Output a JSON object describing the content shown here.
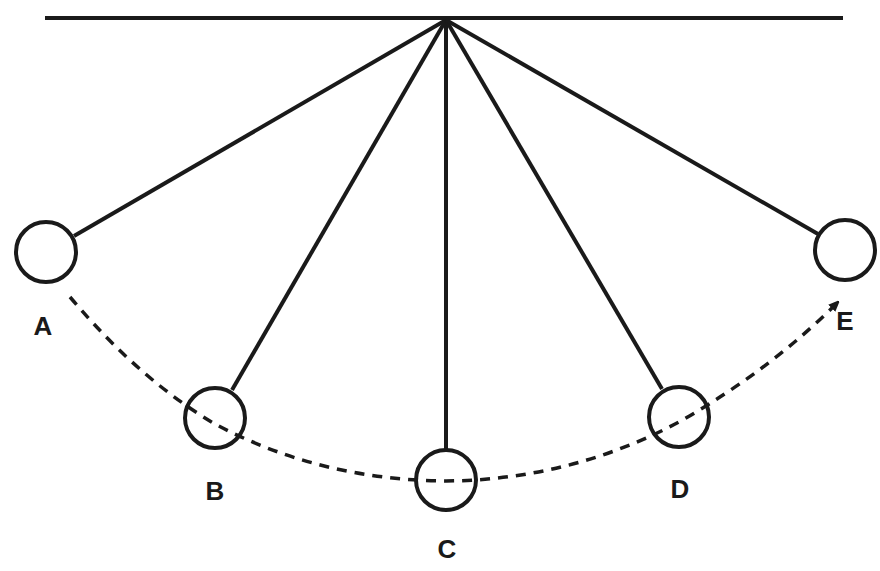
{
  "diagram": {
    "colors": {
      "stroke": "#1a1a1a",
      "background": "#ffffff"
    },
    "support_bar": {
      "x1": 45,
      "x2": 843,
      "y": 18
    },
    "pivot": {
      "x": 446,
      "y": 20
    },
    "bobs": [
      {
        "label": "A",
        "cx": 46,
        "cy": 252,
        "r": 30,
        "lx": 43,
        "ly": 335
      },
      {
        "label": "B",
        "cx": 215,
        "cy": 418,
        "r": 30,
        "lx": 215,
        "ly": 500
      },
      {
        "label": "C",
        "cx": 446,
        "cy": 480,
        "r": 30,
        "lx": 447,
        "ly": 558
      },
      {
        "label": "D",
        "cx": 679,
        "cy": 417,
        "r": 30,
        "lx": 680,
        "ly": 498
      },
      {
        "label": "E",
        "cx": 845,
        "cy": 250,
        "r": 30,
        "lx": 845,
        "ly": 330
      }
    ],
    "path": {
      "style": "dashed",
      "arrow_at": "E",
      "description": "swing arc from A to E"
    }
  }
}
